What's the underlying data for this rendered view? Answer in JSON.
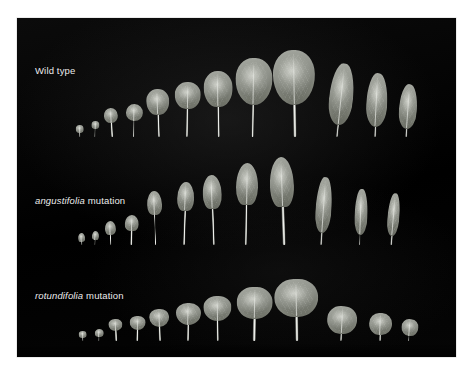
{
  "figure": {
    "background_color": "#ffffff",
    "plate_color": "#010101",
    "leaf_color": "#989b93",
    "label_color": "#ececec",
    "caption_note": ""
  },
  "rows": [
    {
      "id": "wild-type",
      "label_species": "",
      "label_text": "Wild type",
      "label_x": 35,
      "label_y": 65,
      "baseline_y": 137,
      "leaves": [
        {
          "name": "leaf-1",
          "x": 80,
          "blade_w": 8,
          "blade_h": 8,
          "petiole_h": 4,
          "petiole_w": 1.4,
          "shape": "sh-round",
          "rot": -2,
          "detached": false
        },
        {
          "name": "leaf-2",
          "x": 95,
          "blade_w": 8,
          "blade_h": 8,
          "petiole_h": 8,
          "petiole_w": 1.4,
          "shape": "sh-round",
          "rot": 2,
          "detached": false
        },
        {
          "name": "leaf-3",
          "x": 112,
          "blade_w": 14,
          "blade_h": 15,
          "petiole_h": 14,
          "petiole_w": 1.6,
          "shape": "sh-round",
          "rot": -3,
          "detached": false
        },
        {
          "name": "leaf-4",
          "x": 133,
          "blade_w": 17,
          "blade_h": 17,
          "petiole_h": 16,
          "petiole_w": 1.8,
          "shape": "sh-round",
          "rot": 1,
          "detached": false
        },
        {
          "name": "leaf-5",
          "x": 158,
          "blade_w": 23,
          "blade_h": 26,
          "petiole_h": 22,
          "petiole_w": 2.0,
          "shape": "sh-ovate",
          "rot": -2,
          "detached": false
        },
        {
          "name": "leaf-6",
          "x": 187,
          "blade_w": 26,
          "blade_h": 27,
          "petiole_h": 28,
          "petiole_w": 2.2,
          "shape": "sh-ovate",
          "rot": 1,
          "detached": false
        },
        {
          "name": "leaf-7",
          "x": 218,
          "blade_w": 29,
          "blade_h": 36,
          "petiole_h": 30,
          "petiole_w": 2.4,
          "shape": "sh-ovate",
          "rot": -1,
          "detached": false
        },
        {
          "name": "leaf-8",
          "x": 252,
          "blade_w": 37,
          "blade_h": 47,
          "petiole_h": 32,
          "petiole_w": 2.8,
          "shape": "sh-wide",
          "rot": 1,
          "detached": false
        },
        {
          "name": "leaf-9",
          "x": 295,
          "blade_w": 42,
          "blade_h": 55,
          "petiole_h": 32,
          "petiole_w": 3.0,
          "shape": "sh-wide",
          "rot": -1,
          "detached": false
        },
        {
          "name": "leaf-10",
          "x": 337,
          "blade_w": 24,
          "blade_h": 62,
          "petiole_h": 12,
          "petiole_w": 2.2,
          "shape": "sh-lance",
          "rot": 6,
          "detached": true
        },
        {
          "name": "leaf-11",
          "x": 374,
          "blade_w": 21,
          "blade_h": 54,
          "petiole_h": 10,
          "petiole_w": 2.0,
          "shape": "sh-lance",
          "rot": 3,
          "detached": true
        },
        {
          "name": "leaf-12",
          "x": 406,
          "blade_w": 18,
          "blade_h": 45,
          "petiole_h": 8,
          "petiole_w": 1.8,
          "shape": "sh-lance",
          "rot": 4,
          "detached": true
        }
      ]
    },
    {
      "id": "angustifolia-mutation",
      "label_species": "angustifolia",
      "label_text": " mutation",
      "label_x": 35,
      "label_y": 195,
      "baseline_y": 245,
      "leaves": [
        {
          "name": "leaf-1",
          "x": 81,
          "blade_w": 7,
          "blade_h": 9,
          "petiole_h": 3,
          "petiole_w": 1.3,
          "shape": "sh-spatula",
          "rot": -3,
          "detached": false
        },
        {
          "name": "leaf-2",
          "x": 94,
          "blade_w": 7,
          "blade_h": 9,
          "petiole_h": 5,
          "petiole_w": 1.3,
          "shape": "sh-spatula",
          "rot": 3,
          "detached": false
        },
        {
          "name": "leaf-3",
          "x": 110,
          "blade_w": 11,
          "blade_h": 14,
          "petiole_h": 10,
          "petiole_w": 1.5,
          "shape": "sh-spatula",
          "rot": -2,
          "detached": false
        },
        {
          "name": "leaf-4",
          "x": 131,
          "blade_w": 14,
          "blade_h": 16,
          "petiole_h": 14,
          "petiole_w": 1.6,
          "shape": "sh-spatula",
          "rot": 2,
          "detached": false
        },
        {
          "name": "leaf-5",
          "x": 155,
          "blade_w": 15,
          "blade_h": 24,
          "petiole_h": 30,
          "petiole_w": 1.8,
          "shape": "sh-spatula",
          "rot": -2,
          "detached": false
        },
        {
          "name": "leaf-6",
          "x": 183,
          "blade_w": 17,
          "blade_h": 29,
          "petiole_h": 34,
          "petiole_w": 2.0,
          "shape": "sh-spatula",
          "rot": 2,
          "detached": false
        },
        {
          "name": "leaf-7",
          "x": 213,
          "blade_w": 19,
          "blade_h": 34,
          "petiole_h": 36,
          "petiole_w": 2.2,
          "shape": "sh-spatula",
          "rot": -2,
          "detached": false
        },
        {
          "name": "leaf-8",
          "x": 246,
          "blade_w": 22,
          "blade_h": 42,
          "petiole_h": 40,
          "petiole_w": 2.4,
          "shape": "sh-spatula",
          "rot": 1,
          "detached": false
        },
        {
          "name": "leaf-9",
          "x": 284,
          "blade_w": 24,
          "blade_h": 50,
          "petiole_h": 38,
          "petiole_w": 2.6,
          "shape": "sh-spatula",
          "rot": -2,
          "detached": false
        },
        {
          "name": "leaf-10",
          "x": 321,
          "blade_w": 16,
          "blade_h": 56,
          "petiole_h": 12,
          "petiole_w": 2.0,
          "shape": "sh-narrow",
          "rot": 4,
          "detached": true
        },
        {
          "name": "leaf-11",
          "x": 359,
          "blade_w": 13,
          "blade_h": 46,
          "petiole_h": 10,
          "petiole_w": 1.8,
          "shape": "sh-narrow",
          "rot": 2,
          "detached": true
        },
        {
          "name": "leaf-12",
          "x": 391,
          "blade_w": 12,
          "blade_h": 43,
          "petiole_h": 9,
          "petiole_w": 1.7,
          "shape": "sh-narrow",
          "rot": 5,
          "detached": true
        }
      ]
    },
    {
      "id": "rotundifolia-mutation",
      "label_species": "rotundifolia",
      "label_text": " mutation",
      "label_x": 35,
      "label_y": 290,
      "baseline_y": 341,
      "leaves": [
        {
          "name": "leaf-1",
          "x": 83,
          "blade_w": 8,
          "blade_h": 7,
          "petiole_h": 3,
          "petiole_w": 1.3,
          "shape": "sh-round",
          "rot": -3,
          "detached": false
        },
        {
          "name": "leaf-2",
          "x": 98,
          "blade_w": 9,
          "blade_h": 8,
          "petiole_h": 4,
          "petiole_w": 1.4,
          "shape": "sh-round",
          "rot": 2,
          "detached": false
        },
        {
          "name": "leaf-3",
          "x": 116,
          "blade_w": 14,
          "blade_h": 12,
          "petiole_h": 10,
          "petiole_w": 1.6,
          "shape": "sh-wide",
          "rot": -2,
          "detached": false
        },
        {
          "name": "leaf-4",
          "x": 137,
          "blade_w": 16,
          "blade_h": 14,
          "petiole_h": 11,
          "petiole_w": 1.7,
          "shape": "sh-wide",
          "rot": 2,
          "detached": false
        },
        {
          "name": "leaf-5",
          "x": 160,
          "blade_w": 20,
          "blade_h": 18,
          "petiole_h": 14,
          "petiole_w": 1.9,
          "shape": "sh-wide",
          "rot": -2,
          "detached": false
        },
        {
          "name": "leaf-6",
          "x": 187,
          "blade_w": 25,
          "blade_h": 22,
          "petiole_h": 16,
          "petiole_w": 2.1,
          "shape": "sh-wide",
          "rot": 1,
          "detached": false
        },
        {
          "name": "leaf-7",
          "x": 218,
          "blade_w": 28,
          "blade_h": 25,
          "petiole_h": 20,
          "petiole_w": 2.3,
          "shape": "sh-wide",
          "rot": -1,
          "detached": false
        },
        {
          "name": "leaf-8",
          "x": 254,
          "blade_w": 36,
          "blade_h": 32,
          "petiole_h": 22,
          "petiole_w": 2.6,
          "shape": "sh-lobed",
          "rot": 1,
          "detached": false
        },
        {
          "name": "leaf-9",
          "x": 297,
          "blade_w": 44,
          "blade_h": 38,
          "petiole_h": 24,
          "petiole_w": 3.0,
          "shape": "sh-lobed",
          "rot": -1,
          "detached": false
        },
        {
          "name": "leaf-10",
          "x": 341,
          "blade_w": 30,
          "blade_h": 28,
          "petiole_h": 7,
          "petiole_w": 2.2,
          "shape": "sh-lobed",
          "rot": 3,
          "detached": true
        },
        {
          "name": "leaf-11",
          "x": 379,
          "blade_w": 23,
          "blade_h": 22,
          "petiole_h": 6,
          "petiole_w": 2.0,
          "shape": "sh-lobed",
          "rot": 2,
          "detached": true
        },
        {
          "name": "leaf-12",
          "x": 408,
          "blade_w": 17,
          "blade_h": 17,
          "petiole_h": 5,
          "petiole_w": 1.8,
          "shape": "sh-lobed",
          "rot": 4,
          "detached": true
        }
      ]
    }
  ]
}
